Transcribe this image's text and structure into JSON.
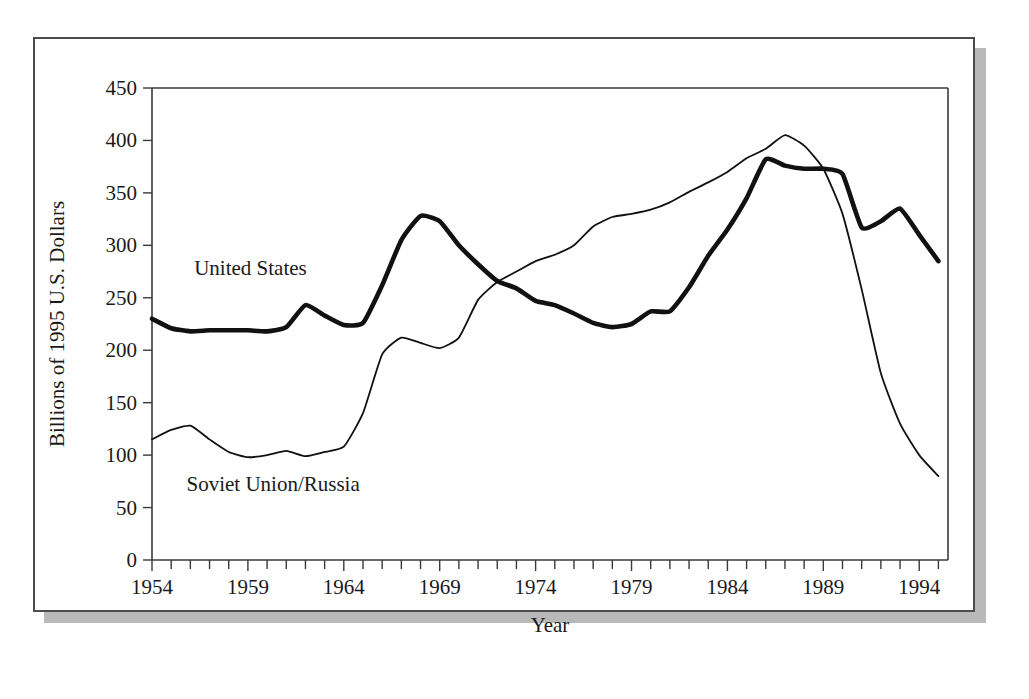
{
  "figure": {
    "frame_color": "#4c4c4c",
    "shadow_color": "#b9b9b9",
    "background": "#ffffff"
  },
  "chart_data": {
    "type": "line",
    "title": "",
    "subtitle": "",
    "xlabel": "Year",
    "ylabel": "Billions of 1995 U.S. Dollars",
    "xlim": [
      1954,
      1995.5
    ],
    "ylim": [
      0,
      450
    ],
    "grid": false,
    "legend_position": "inline-annotation",
    "x_major_ticks": [
      1954,
      1959,
      1964,
      1969,
      1974,
      1979,
      1984,
      1989,
      1994
    ],
    "x_major_tick_labels": [
      "1954",
      "1959",
      "1964",
      "1969",
      "1974",
      "1979",
      "1984",
      "1989",
      "1994"
    ],
    "x_minor_tick_interval": 1,
    "y_ticks": [
      0,
      50,
      100,
      150,
      200,
      250,
      300,
      350,
      400,
      450
    ],
    "y_tick_labels": [
      "0",
      "50",
      "100",
      "150",
      "200",
      "250",
      "300",
      "350",
      "400",
      "450"
    ],
    "x": [
      1954,
      1955,
      1956,
      1957,
      1958,
      1959,
      1960,
      1961,
      1962,
      1963,
      1964,
      1965,
      1966,
      1967,
      1968,
      1969,
      1970,
      1971,
      1972,
      1973,
      1974,
      1975,
      1976,
      1977,
      1978,
      1979,
      1980,
      1981,
      1982,
      1983,
      1984,
      1985,
      1986,
      1987,
      1988,
      1989,
      1990,
      1991,
      1992,
      1993,
      1994,
      1995
    ],
    "series": [
      {
        "name": "United States",
        "color": "#111111",
        "line_width": 4.6,
        "label_x": 1956.2,
        "label_y": 272,
        "values": [
          230,
          221,
          218,
          219,
          219,
          219,
          218,
          222,
          243,
          233,
          224,
          226,
          262,
          305,
          328,
          323,
          300,
          282,
          266,
          259,
          247,
          243,
          235,
          226,
          222,
          225,
          237,
          237,
          260,
          290,
          315,
          345,
          382,
          376,
          373,
          373,
          368,
          317,
          323,
          335,
          310,
          285
        ]
      },
      {
        "name": "Soviet Union/Russia",
        "color": "#111111",
        "line_width": 1.8,
        "label_x": 1955.8,
        "label_y": 66,
        "values": [
          115,
          124,
          128,
          115,
          103,
          98,
          100,
          104,
          99,
          103,
          108,
          140,
          196,
          212,
          207,
          202,
          212,
          248,
          265,
          275,
          285,
          291,
          300,
          318,
          327,
          330,
          334,
          341,
          351,
          360,
          370,
          383,
          392,
          405,
          395,
          373,
          330,
          258,
          178,
          130,
          100,
          80
        ]
      }
    ],
    "annotations": [
      {
        "text": "United States",
        "x": 1956.2,
        "y": 272
      },
      {
        "text": "Soviet Union/Russia",
        "x": 1955.8,
        "y": 66
      }
    ]
  }
}
